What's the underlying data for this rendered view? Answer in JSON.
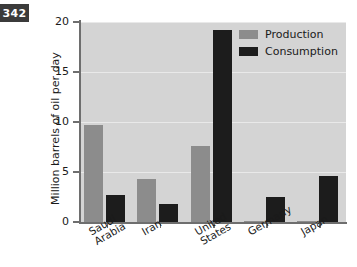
{
  "page_badge": {
    "number": "342"
  },
  "chart_data": {
    "type": "bar",
    "title": "",
    "xlabel": "",
    "ylabel": "Million barrels of oil per day",
    "ylim": [
      0,
      20
    ],
    "yticks": [
      0,
      5,
      10,
      15,
      20
    ],
    "ytick_labels": [
      "0",
      "5",
      "10",
      "15",
      "20"
    ],
    "grid": true,
    "legend_position": "top-right",
    "categories": [
      "Saudi Arabia",
      "Iran",
      "United States",
      "Germany",
      "Japan"
    ],
    "category_lines": [
      [
        "Saudi",
        "Arabia"
      ],
      [
        "Iran"
      ],
      [
        "United",
        "States"
      ],
      [
        "Germany"
      ],
      [
        "Japan"
      ]
    ],
    "series": [
      {
        "name": "Production",
        "color": "#8c8c8c",
        "values": [
          9.7,
          4.3,
          7.6,
          0.15,
          0.1
        ]
      },
      {
        "name": "Consumption",
        "color": "#1c1c1c",
        "values": [
          2.7,
          1.8,
          19.2,
          2.5,
          4.6
        ]
      }
    ]
  },
  "colors": {
    "plot_background": "#d4d4d4",
    "gridline": "#e9e9e9",
    "axis": "#6e6e6e",
    "badge_background": "#3b3b3b",
    "badge_text": "#ffffff"
  }
}
